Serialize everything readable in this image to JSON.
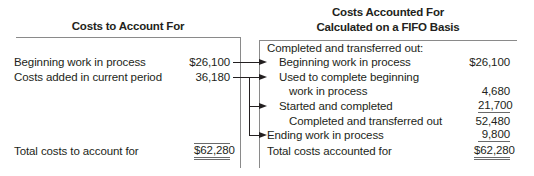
{
  "left": {
    "header": "Costs to Account For",
    "rows": [
      {
        "label": "Beginning work in process",
        "value": "$26,100"
      },
      {
        "label": "Costs added in current period",
        "value": "36,180"
      }
    ],
    "total": {
      "label": "Total costs to account for",
      "value": "$62,280"
    }
  },
  "right": {
    "header_line1": "Costs Accounted For",
    "header_line2": "Calculated on a FIFO Basis",
    "section_label": "Completed and transferred out:",
    "rows": [
      {
        "label": "Beginning work in process",
        "value": "$26,100"
      },
      {
        "label": "Used to complete beginning",
        "value": ""
      },
      {
        "label": "work in process",
        "value": "4,680"
      },
      {
        "label": "Started and completed",
        "value": "21,700"
      },
      {
        "label": "Completed and transferred out",
        "value": "52,480"
      },
      {
        "label": "Ending work in process",
        "value": "9,800"
      }
    ],
    "total": {
      "label": "Total costs accounted for",
      "value": "$62,280"
    }
  },
  "connectors": [
    {
      "from": "Beginning work in process",
      "to": "Beginning work in process"
    },
    {
      "from": "Costs added in current period",
      "to": "Used to complete beginning"
    },
    {
      "from": "Costs added in current period",
      "to": "Started and completed"
    },
    {
      "from": "Costs added in current period",
      "to": "Ending work in process"
    }
  ]
}
